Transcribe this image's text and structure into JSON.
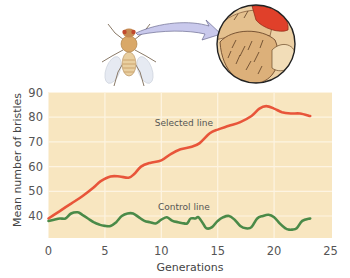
{
  "illustration": {
    "subject": "fruit fly (Drosophila) with magnified view of bristles on thorax",
    "arrow_color": "#c9c9ec",
    "magnifier_eye_color": "#e0402a"
  },
  "chart_data": {
    "type": "line",
    "title": "",
    "xlabel": "Generations",
    "ylabel": "Mean number of bristles",
    "xlim": [
      0,
      25
    ],
    "ylim": [
      31.5,
      90
    ],
    "xticks": [
      0,
      5,
      10,
      15,
      20,
      25
    ],
    "yticks": [
      40,
      50,
      60,
      70,
      80,
      90
    ],
    "grid": true,
    "background": "#f8e6c0",
    "grid_color": "#fdf4e2",
    "legend": "inline labels",
    "series": [
      {
        "name": "Selected line",
        "color": "#e8553a",
        "label_pos": {
          "x": 12.0,
          "y": 76.5
        },
        "x": [
          0,
          1,
          2,
          3,
          4,
          4.6,
          5.5,
          6.3,
          7.1,
          7.6,
          8.2,
          9,
          10,
          10.8,
          11.7,
          12.7,
          13.4,
          14.3,
          15,
          16,
          17,
          18,
          18.7,
          19.3,
          20,
          20.7,
          21.5,
          22.3,
          23.2
        ],
        "y": [
          39,
          42,
          45,
          48,
          51.5,
          54,
          56,
          56,
          55.5,
          57,
          60,
          61.5,
          62.5,
          65,
          67,
          68,
          69.5,
          73.5,
          75,
          76.5,
          78,
          80.5,
          83.5,
          84.5,
          83.5,
          82,
          81.5,
          81.5,
          80.5
        ]
      },
      {
        "name": "Control line",
        "color": "#4a8a48",
        "label_pos": {
          "x": 12.0,
          "y": 42.5
        },
        "x": [
          0,
          0.5,
          1,
          1.5,
          2,
          2.6,
          3,
          3.5,
          4,
          4.5,
          5,
          5.5,
          6,
          6.5,
          7,
          7.5,
          8,
          8.5,
          9,
          9.5,
          10,
          10.5,
          11,
          11.5,
          12,
          12.3,
          12.6,
          13,
          13.3,
          13.7,
          14,
          14.5,
          15,
          15.5,
          16,
          16.5,
          17,
          17.5,
          18,
          18.5,
          19,
          19.5,
          20,
          20.5,
          21,
          21.3,
          21.6,
          22,
          22.5,
          23.2
        ],
        "y": [
          38,
          38.5,
          39,
          39,
          41,
          41.5,
          40.5,
          39,
          37.5,
          36.5,
          36,
          36,
          37.5,
          40,
          41,
          41,
          39.5,
          38,
          37.5,
          37,
          38.5,
          39.5,
          38,
          37.5,
          37,
          37,
          39,
          39,
          39.5,
          37,
          35,
          35.5,
          38,
          39.5,
          40,
          38.5,
          36,
          35,
          35.5,
          39,
          40,
          40.5,
          39.5,
          37,
          35,
          34.5,
          34.5,
          35,
          38,
          39
        ]
      }
    ]
  }
}
